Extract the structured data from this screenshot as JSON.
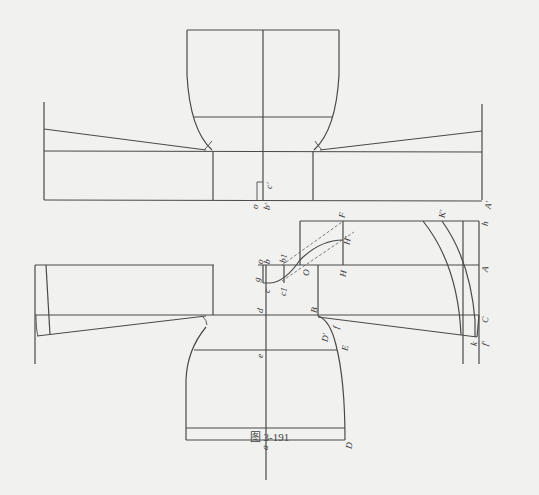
{
  "figure": {
    "caption": "图 3-191",
    "type": "garment pattern drafting diagram (shirt with sleeves and collar)"
  },
  "labels": {
    "top": {
      "o": "o",
      "b_prime": "b'",
      "c_prime": "c'",
      "A_prime": "A'"
    },
    "bottom": {
      "g": "g",
      "o": "o",
      "b": "b",
      "b1": "b1",
      "c": "c",
      "c1": "c1",
      "O": "O",
      "F": "F",
      "H_prime": "H'",
      "H": "H",
      "d": "d",
      "B": "B",
      "f": "f",
      "D_prime": "D'",
      "E": "E",
      "e": "e",
      "a": "a",
      "D": "D",
      "K_prime": "K'",
      "h": "h",
      "A": "A",
      "C": "C",
      "k": "k",
      "f_prime": "f'"
    }
  }
}
